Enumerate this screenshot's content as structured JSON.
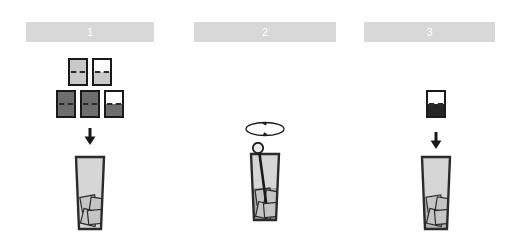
{
  "figure": {
    "title": "",
    "background_color": "#ffffff",
    "panel_count": 3
  },
  "style": {
    "header_bar_color": "#d8d8d8",
    "header_number_color": "#ffffff",
    "outline_color": "#1a1a1a",
    "card_light_gray": "#c9c9c9",
    "card_dark_gray": "#6e6e6e",
    "card_white": "#ffffff",
    "glass_body_color": "#d6d6d6",
    "glass_liquid_color": "#a8a8a8",
    "glass_outline_color": "#2b2b2b",
    "ice_cube_fill": "#c4c4c4",
    "ice_cube_outline": "#2b2b2b",
    "arrow_color": "#1a1a1a",
    "rod_color": "#1a1a1a"
  },
  "panels": [
    {
      "id": "panel-1",
      "number": "1",
      "step_name": "add-ice-cubes",
      "elements": {
        "cards_label": "ice-cube-cards",
        "arrow_label": "transfer-arrow-down",
        "vessel_label": "glass-with-ice"
      },
      "card_rows": [
        [
          {
            "name": "card-light-dashed",
            "top": "#c9c9c9",
            "bottom": "#c9c9c9",
            "dashed": true
          },
          {
            "name": "card-white-top-light-bottom",
            "top": "#ffffff",
            "bottom": "#c9c9c9",
            "dashed": true
          }
        ],
        [
          {
            "name": "card-dark-dashed-a",
            "top": "#6e6e6e",
            "bottom": "#6e6e6e",
            "dashed": true
          },
          {
            "name": "card-dark-dashed-b",
            "top": "#6e6e6e",
            "bottom": "#6e6e6e",
            "dashed": true
          },
          {
            "name": "card-white-top-dark-bottom",
            "top": "#ffffff",
            "bottom": "#6e6e6e",
            "dashed": true
          }
        ]
      ],
      "glass": {
        "liquid_level": 0,
        "ice_cube_count": 4,
        "has_stir_rod": false
      }
    },
    {
      "id": "panel-2",
      "number": "2",
      "step_name": "stir-rotate",
      "elements": {
        "rotation_label": "rotation-arrow-ellipse",
        "vessel_label": "glass-with-stir-rod"
      },
      "card_rows": [],
      "glass": {
        "liquid_level": 0.52,
        "ice_cube_count": 4,
        "has_stir_rod": true
      }
    },
    {
      "id": "panel-3",
      "number": "3",
      "step_name": "add-sample",
      "elements": {
        "cards_label": "sample-card",
        "arrow_label": "transfer-arrow-down",
        "vessel_label": "glass-with-ice"
      },
      "card_rows": [
        [
          {
            "name": "card-white-top-dark-bottom",
            "top": "#ffffff",
            "bottom": "#262626",
            "dashed": true
          }
        ]
      ],
      "glass": {
        "liquid_level": 0.38,
        "ice_cube_count": 4,
        "has_stir_rod": false
      }
    }
  ]
}
